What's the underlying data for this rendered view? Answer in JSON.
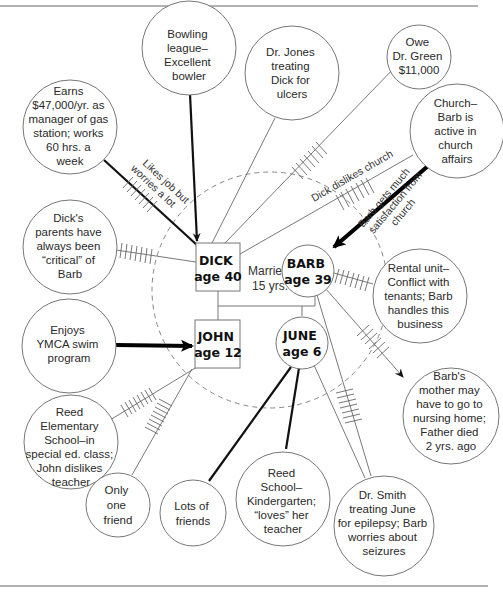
{
  "diagram": {
    "household": {
      "marriage_label": [
        "Married",
        "15 yrs."
      ],
      "members": [
        {
          "id": "dick",
          "name": "DICK",
          "age_label": "age 40",
          "shape": "square",
          "sex": "male"
        },
        {
          "id": "barb",
          "name": "BARB",
          "age_label": "age 39",
          "shape": "circle",
          "sex": "female"
        },
        {
          "id": "john",
          "name": "JOHN",
          "age_label": "age 12",
          "shape": "square",
          "sex": "male"
        },
        {
          "id": "june",
          "name": "JUNE",
          "age_label": "age 6",
          "shape": "circle",
          "sex": "female"
        }
      ]
    },
    "systems": [
      {
        "id": "earns",
        "lines": [
          "Earns",
          "$47,000/yr. as",
          "manager of gas",
          "station; works",
          "60 hrs. a",
          "week"
        ]
      },
      {
        "id": "bowling",
        "lines": [
          "Bowling",
          "league–",
          "Excellent",
          "bowler"
        ]
      },
      {
        "id": "drjones",
        "lines": [
          "Dr. Jones",
          "treating",
          "Dick for",
          "ulcers"
        ]
      },
      {
        "id": "drgreen",
        "lines": [
          "Owe",
          "Dr. Green",
          "$11,000"
        ]
      },
      {
        "id": "church",
        "lines": [
          "Church–",
          "Barb is",
          "active in",
          "church",
          "affairs"
        ]
      },
      {
        "id": "parents",
        "lines": [
          "Dick's",
          "parents have",
          "always been",
          "“critical” of",
          "Barb"
        ]
      },
      {
        "id": "rental",
        "lines": [
          "Rental unit–",
          "Conflict with",
          "tenants; Barb",
          "handles this",
          "business"
        ]
      },
      {
        "id": "ymca",
        "lines": [
          "Enjoys",
          "YMCA swim",
          "program"
        ]
      },
      {
        "id": "mother",
        "lines": [
          "Barb's",
          "mother may",
          "have to go to",
          "nursing home;",
          "Father died",
          "2 yrs. ago"
        ]
      },
      {
        "id": "reedelem",
        "lines": [
          "Reed",
          "Elementary",
          "School–in",
          "special ed. class;",
          "John dislikes",
          "teacher"
        ]
      },
      {
        "id": "onefriend",
        "lines": [
          "Only",
          "one",
          "friend"
        ]
      },
      {
        "id": "lotsfriends",
        "lines": [
          "Lots of",
          "friends"
        ]
      },
      {
        "id": "reedk",
        "lines": [
          "Reed",
          "School–",
          "Kindergarten;",
          "“loves” her",
          "teacher"
        ]
      },
      {
        "id": "drsmith",
        "lines": [
          "Dr. Smith",
          "treating June",
          "for epilepsy; Barb",
          "worries about",
          "seizures"
        ]
      }
    ],
    "connection_labels": {
      "job": [
        "Likes job but",
        "worries a lot"
      ],
      "dick_church": "Dick dislikes church",
      "barb_church": [
        "Barb gets much",
        "satisfaction from",
        "church"
      ]
    },
    "connections": [
      {
        "from": "earns",
        "to": "dick",
        "type": "strong+stressful"
      },
      {
        "from": "bowling",
        "to": "dick",
        "type": "strong",
        "arrow": "to dick"
      },
      {
        "from": "drjones",
        "to": "dick",
        "type": "tenuous"
      },
      {
        "from": "drgreen",
        "to": "dick",
        "type": "stressful"
      },
      {
        "from": "church",
        "to": "dick",
        "type": "stressful"
      },
      {
        "from": "church",
        "to": "barb",
        "type": "very strong",
        "arrow": "to barb"
      },
      {
        "from": "parents",
        "to": "dick",
        "type": "stressful"
      },
      {
        "from": "rental",
        "to": "barb",
        "type": "stressful"
      },
      {
        "from": "ymca",
        "to": "john",
        "type": "very strong",
        "arrow": "to john"
      },
      {
        "from": "barb",
        "to": "mother",
        "type": "stressful",
        "arrow": "to mother"
      },
      {
        "from": "reedelem",
        "to": "john",
        "type": "stressful"
      },
      {
        "from": "onefriend",
        "to": "john",
        "type": "stressful"
      },
      {
        "from": "lotsfriends",
        "to": "june",
        "type": "strong"
      },
      {
        "from": "reedk",
        "to": "june",
        "type": "strong"
      },
      {
        "from": "drsmith",
        "to": "june",
        "type": "tenuous"
      },
      {
        "from": "drsmith",
        "to": "barb",
        "type": "stressful"
      }
    ]
  }
}
